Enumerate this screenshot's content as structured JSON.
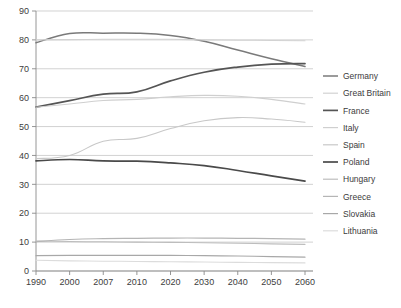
{
  "chart_data": {
    "type": "line",
    "title": "",
    "subtitle": "",
    "xlabel": "",
    "ylabel": "",
    "x": [
      1990,
      2000,
      2007,
      2010,
      2020,
      2030,
      2040,
      2050,
      2060
    ],
    "x_tick_labels": [
      "1990",
      "2000",
      "2007",
      "2010",
      "2020",
      "2030",
      "2040",
      "2050",
      "2060"
    ],
    "y_tick_labels": [
      "0",
      "10",
      "20",
      "30",
      "40",
      "50",
      "60",
      "70",
      "80",
      "90"
    ],
    "y_ticks": [
      0,
      10,
      20,
      30,
      40,
      50,
      60,
      70,
      80,
      90
    ],
    "ylim": [
      0,
      90
    ],
    "grid": "horizontal",
    "legend_position": "right",
    "series": [
      {
        "name": "Germany",
        "color": "#7a7a7a",
        "width": 1.5,
        "values": [
          79.0,
          82.2,
          82.3,
          82.3,
          81.5,
          79.5,
          76.5,
          73.5,
          70.8
        ]
      },
      {
        "name": "Great Britain",
        "color": "#d2d2d2",
        "width": 1.1,
        "values": [
          80.0,
          80.1,
          80.2,
          80.2,
          80.2,
          80.0,
          79.9,
          79.8,
          79.7
        ]
      },
      {
        "name": "France",
        "color": "#555555",
        "width": 1.7,
        "values": [
          56.7,
          59.0,
          61.2,
          62.0,
          65.8,
          68.8,
          70.6,
          71.6,
          71.8
        ]
      },
      {
        "name": "Italy",
        "color": "#cfcfcf",
        "width": 1.1,
        "values": [
          56.7,
          57.8,
          59.0,
          59.4,
          60.3,
          60.8,
          60.5,
          59.4,
          57.8
        ]
      },
      {
        "name": "Spain",
        "color": "#c8c8c8",
        "width": 1.1,
        "values": [
          38.9,
          40.0,
          44.9,
          45.9,
          49.3,
          52.0,
          53.1,
          52.6,
          51.5
        ]
      },
      {
        "name": "Poland",
        "color": "#4a4a4a",
        "width": 1.7,
        "values": [
          38.1,
          38.6,
          38.1,
          38.0,
          37.4,
          36.5,
          34.8,
          32.9,
          31.1
        ]
      },
      {
        "name": "Hungary",
        "color": "#bdbdbd",
        "width": 1.1,
        "values": [
          10.4,
          10.2,
          10.1,
          10.0,
          9.9,
          9.8,
          9.6,
          9.4,
          9.2
        ]
      },
      {
        "name": "Greece",
        "color": "#b5b5b5",
        "width": 1.2,
        "values": [
          10.2,
          10.9,
          11.2,
          11.3,
          11.4,
          11.4,
          11.3,
          11.2,
          11.0
        ]
      },
      {
        "name": "Slovakia",
        "color": "#a8a8a8",
        "width": 1.2,
        "values": [
          5.3,
          5.4,
          5.4,
          5.4,
          5.4,
          5.3,
          5.2,
          5.0,
          4.8
        ]
      },
      {
        "name": "Lithuania",
        "color": "#dcdcdc",
        "width": 1.1,
        "values": [
          3.7,
          3.5,
          3.4,
          3.3,
          3.2,
          3.1,
          3.0,
          2.9,
          2.8
        ]
      }
    ]
  }
}
